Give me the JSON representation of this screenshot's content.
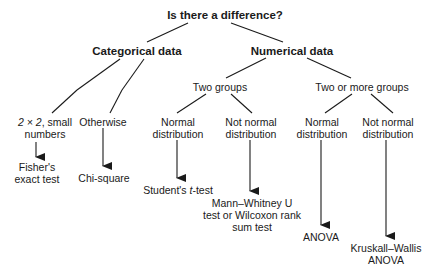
{
  "diagram": {
    "type": "decision-tree",
    "root": "Is there a difference?",
    "level1": {
      "categorical": "Categorical data",
      "numerical": "Numerical data"
    },
    "categorical_branches": {
      "small": {
        "line1_italic": "2 × 2",
        "line1_rest": ", small",
        "line2": "numbers"
      },
      "otherwise": "Otherwise"
    },
    "categorical_tests": {
      "fisher": {
        "line1": "Fisher's",
        "line2": "exact test"
      },
      "chi": "Chi-square"
    },
    "numerical_branches": {
      "two": "Two groups",
      "more": "Two or more groups"
    },
    "distributions": {
      "two_normal": {
        "line1": "Normal",
        "line2": "distribution"
      },
      "two_not_normal": {
        "line1": "Not normal",
        "line2": "distribution"
      },
      "more_normal": {
        "line1": "Normal",
        "line2": "distribution"
      },
      "more_not_normal": {
        "line1": "Not normal",
        "line2": "distribution"
      }
    },
    "numerical_tests": {
      "student": {
        "pre": "Student's ",
        "italic": "t",
        "post": "-test"
      },
      "mann": {
        "line1": "Mann–Whitney U",
        "line2": "test or Wilcoxon rank",
        "line3": "sum test"
      },
      "anova": "ANOVA",
      "kruskal": {
        "line1": "Kruskall–Wallis",
        "line2": "ANOVA"
      }
    },
    "colors": {
      "line": "#1a1a1a",
      "text": "#1a1a1a",
      "background": "#ffffff"
    }
  }
}
